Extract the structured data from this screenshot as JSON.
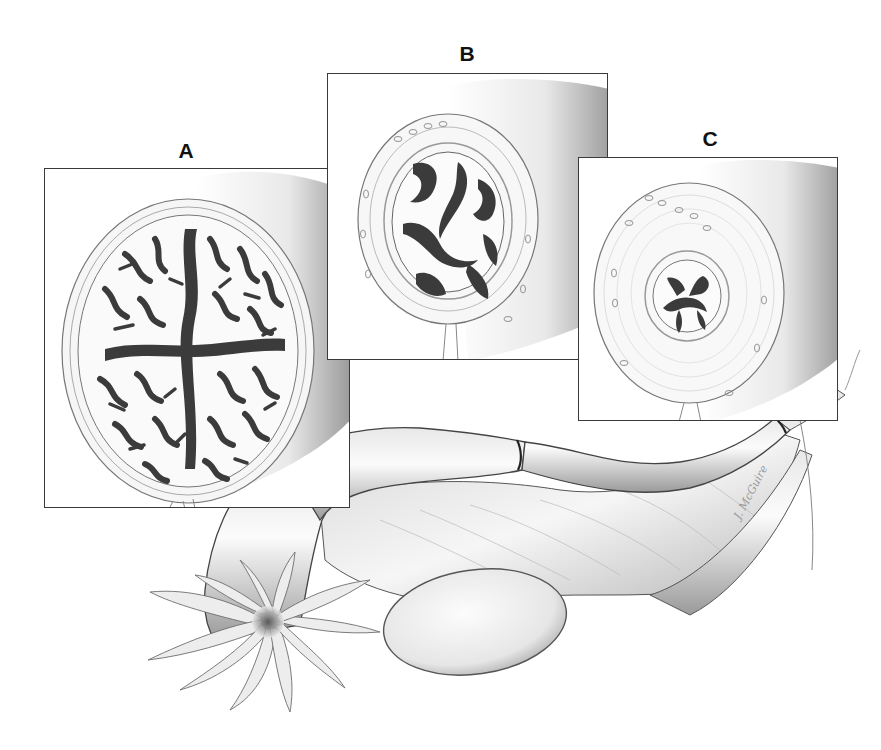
{
  "figure": {
    "panels": [
      {
        "id": "A",
        "label": "A",
        "region": "ampulla",
        "lumen": "highly folded mucosa"
      },
      {
        "id": "B",
        "label": "B",
        "region": "isthmus",
        "lumen": "moderately folded mucosa"
      },
      {
        "id": "C",
        "label": "C",
        "region": "intramural",
        "lumen": "few simple folds"
      }
    ],
    "signature": "J. McGuire",
    "colors": {
      "background": "#ffffff",
      "border": "#3a3a3a",
      "label": "#111111",
      "tissue_light": "#f2f2f2",
      "tissue_mid": "#bdbdbd",
      "fold_dark": "#3b3b3b"
    }
  }
}
